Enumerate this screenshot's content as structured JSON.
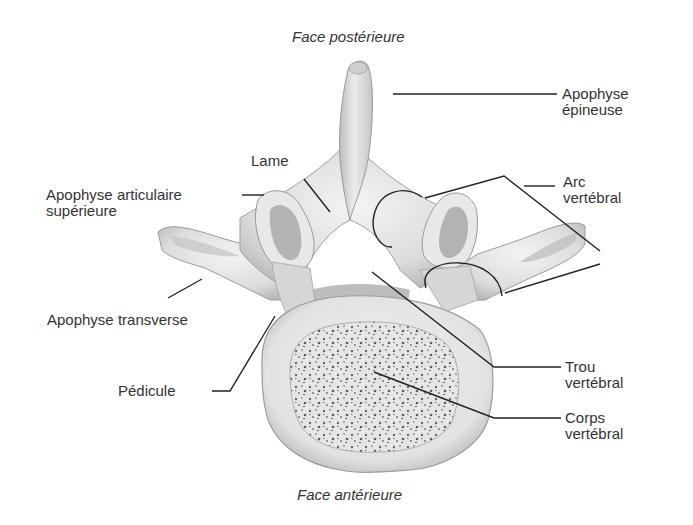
{
  "diagram": {
    "captions": {
      "top": "Face postérieure",
      "bottom": "Face antérieure"
    },
    "labels": {
      "apophyse_epineuse": {
        "line1": "Apophyse",
        "line2": "épineuse"
      },
      "arc_vertebral": {
        "line1": "Arc",
        "line2": "vertébral"
      },
      "lame": {
        "line1": "Lame"
      },
      "apophyse_articulaire_superieure": {
        "line1": "Apophyse articulaire",
        "line2": "supérieure"
      },
      "apophyse_transverse": {
        "line1": "Apophyse transverse"
      },
      "pedicule": {
        "line1": "Pédicule"
      },
      "trou_vertebral": {
        "line1": "Trou",
        "line2": "vertébral"
      },
      "corps_vertebral": {
        "line1": "Corps",
        "line2": "vertébral"
      }
    },
    "colors": {
      "bone_light": "#ececec",
      "bone_mid": "#cfcfcf",
      "bone_shadow": "#a8a8a8",
      "leader_line": "#222222",
      "text": "#333333"
    }
  }
}
